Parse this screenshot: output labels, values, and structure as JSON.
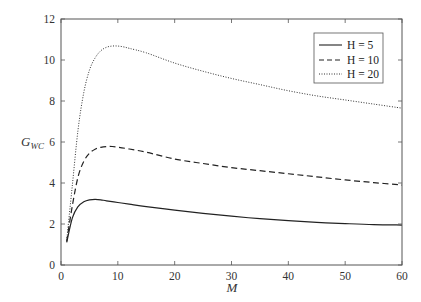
{
  "chart_data": {
    "type": "line",
    "title": "",
    "xlabel": "M",
    "ylabel": "G_WC",
    "xlim": [
      0,
      60
    ],
    "ylim": [
      0,
      12
    ],
    "xticks": [
      0,
      10,
      20,
      30,
      40,
      50,
      60
    ],
    "yticks": [
      0,
      2,
      4,
      6,
      8,
      10,
      12
    ],
    "grid": false,
    "legend_position": "upper right",
    "series": [
      {
        "name": "H = 5",
        "style": "solid",
        "x": [
          1,
          2,
          3,
          4,
          5,
          6,
          7,
          8,
          10,
          12,
          15,
          20,
          25,
          30,
          35,
          40,
          45,
          50,
          55,
          60
        ],
        "values": [
          1.1,
          2.3,
          2.85,
          3.08,
          3.18,
          3.2,
          3.18,
          3.13,
          3.05,
          2.97,
          2.85,
          2.68,
          2.52,
          2.38,
          2.26,
          2.16,
          2.08,
          2.02,
          1.97,
          1.95
        ]
      },
      {
        "name": "H = 10",
        "style": "dashed",
        "x": [
          1,
          2,
          3,
          4,
          5,
          6,
          7,
          8,
          9,
          10,
          12,
          15,
          20,
          25,
          30,
          35,
          40,
          45,
          50,
          55,
          60
        ],
        "values": [
          1.15,
          2.9,
          4.3,
          5.05,
          5.45,
          5.65,
          5.74,
          5.78,
          5.78,
          5.75,
          5.66,
          5.5,
          5.17,
          4.95,
          4.75,
          4.6,
          4.45,
          4.3,
          4.15,
          4.02,
          3.9
        ]
      },
      {
        "name": "H = 20",
        "style": "dotted",
        "x": [
          1,
          2,
          3,
          4,
          5,
          6,
          7,
          8,
          9,
          10,
          11,
          12,
          15,
          20,
          25,
          30,
          35,
          40,
          45,
          50,
          55,
          60
        ],
        "values": [
          1.2,
          3.9,
          6.6,
          8.4,
          9.5,
          10.1,
          10.45,
          10.62,
          10.68,
          10.68,
          10.64,
          10.57,
          10.35,
          9.85,
          9.45,
          9.1,
          8.8,
          8.5,
          8.25,
          8.05,
          7.85,
          7.65
        ]
      }
    ]
  },
  "axes": {
    "xlabel": "M",
    "ylabel_main": "G",
    "ylabel_sub": "WC"
  },
  "legend": {
    "items": [
      {
        "label": "H = 5"
      },
      {
        "label": "H = 10"
      },
      {
        "label": "H = 20"
      }
    ]
  }
}
